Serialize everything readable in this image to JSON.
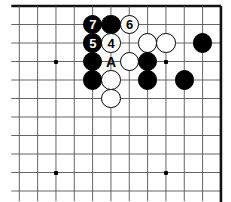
{
  "figure": {
    "kind": "go-board-diagram",
    "width": 231,
    "height": 202,
    "background_color": "#ffffff",
    "line_color": "#555555",
    "edge_color": "#111111",
    "black_color": "#000000",
    "white_color": "#ffffff"
  },
  "board": {
    "origin_x": 19.3,
    "origin_y": 6,
    "col_spacing": 18.33,
    "row_spacing": 18.5,
    "cols": 12,
    "rows": 11,
    "thick_edges": [
      "top",
      "right"
    ],
    "star_points": [
      {
        "col": 2,
        "row": 3
      },
      {
        "col": 8,
        "row": 3
      },
      {
        "col": 2,
        "row": 9
      },
      {
        "col": 8,
        "row": 9
      }
    ]
  },
  "stones": [
    {
      "col": 4,
      "row": 1,
      "color": "black",
      "label": "7"
    },
    {
      "col": 5,
      "row": 1,
      "color": "black",
      "label": ""
    },
    {
      "col": 6,
      "row": 1,
      "color": "white",
      "label": "6"
    },
    {
      "col": 4,
      "row": 2,
      "color": "black",
      "label": "5"
    },
    {
      "col": 5,
      "row": 2,
      "color": "white",
      "label": "4"
    },
    {
      "col": 7,
      "row": 2,
      "color": "white",
      "label": ""
    },
    {
      "col": 8,
      "row": 2,
      "color": "white",
      "label": ""
    },
    {
      "col": 10,
      "row": 2,
      "color": "black",
      "label": ""
    },
    {
      "col": 4,
      "row": 3,
      "color": "black",
      "label": ""
    },
    {
      "col": 6,
      "row": 3,
      "color": "white",
      "label": ""
    },
    {
      "col": 7,
      "row": 3,
      "color": "black",
      "label": ""
    },
    {
      "col": 4,
      "row": 4,
      "color": "black",
      "label": ""
    },
    {
      "col": 5,
      "row": 4,
      "color": "white",
      "label": ""
    },
    {
      "col": 7,
      "row": 4,
      "color": "black",
      "label": ""
    },
    {
      "col": 9,
      "row": 4,
      "color": "black",
      "label": ""
    },
    {
      "col": 5,
      "row": 5,
      "color": "white",
      "label": ""
    }
  ],
  "point_labels": [
    {
      "col": 5,
      "row": 3,
      "text": "A"
    }
  ],
  "move_numbers": {
    "four": "4",
    "five": "5",
    "six": "6",
    "seven": "7"
  }
}
